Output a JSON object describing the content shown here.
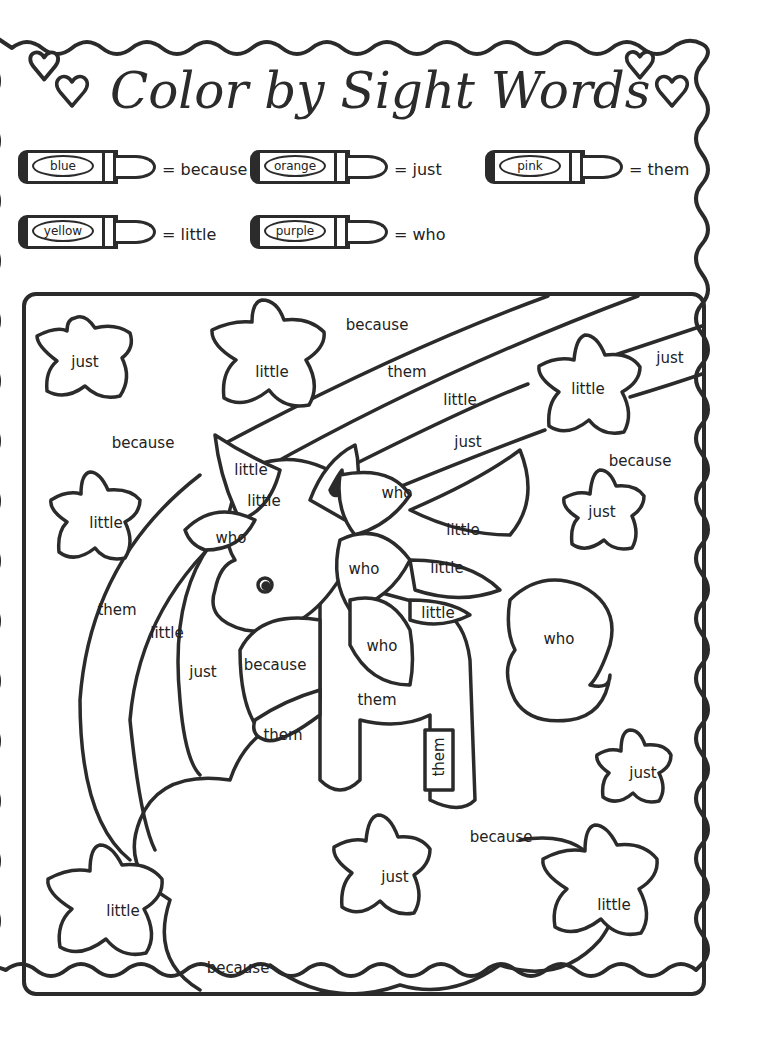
{
  "worksheet": {
    "title": "Color by Sight Words",
    "decorations": [
      "heart-icon",
      "heart-icon",
      "heart-icon",
      "heart-icon"
    ]
  },
  "key": [
    {
      "color": "blue",
      "hex": "#3b6fd8",
      "word": "= because"
    },
    {
      "color": "orange",
      "hex": "#f28c28",
      "word": "= just"
    },
    {
      "color": "pink",
      "hex": "#f48fb1",
      "word": "= them"
    },
    {
      "color": "yellow",
      "hex": "#f5d90a",
      "word": "= little"
    },
    {
      "color": "purple",
      "hex": "#8e44ad",
      "word": "= who"
    }
  ],
  "regions": [
    {
      "word": "just",
      "shape": "star",
      "x": 85,
      "y": 362
    },
    {
      "word": "little",
      "shape": "star",
      "x": 272,
      "y": 372
    },
    {
      "word": "because",
      "shape": "sky",
      "x": 377,
      "y": 325
    },
    {
      "word": "them",
      "shape": "rainbow",
      "x": 407,
      "y": 372
    },
    {
      "word": "little",
      "shape": "rainbow",
      "x": 460,
      "y": 400
    },
    {
      "word": "just",
      "shape": "rainbow",
      "x": 468,
      "y": 442
    },
    {
      "word": "little",
      "shape": "star",
      "x": 588,
      "y": 389
    },
    {
      "word": "just",
      "shape": "rainbow",
      "x": 670,
      "y": 358
    },
    {
      "word": "because",
      "shape": "sky",
      "x": 143,
      "y": 443
    },
    {
      "word": "because",
      "shape": "sky",
      "x": 640,
      "y": 461
    },
    {
      "word": "little",
      "shape": "horn",
      "x": 251,
      "y": 470
    },
    {
      "word": "little",
      "shape": "horn",
      "x": 264,
      "y": 501
    },
    {
      "word": "who",
      "shape": "mane",
      "x": 397,
      "y": 493
    },
    {
      "word": "little",
      "shape": "star",
      "x": 106,
      "y": 523
    },
    {
      "word": "just",
      "shape": "star",
      "x": 602,
      "y": 512
    },
    {
      "word": "who",
      "shape": "mane",
      "x": 231,
      "y": 538
    },
    {
      "word": "little",
      "shape": "mane",
      "x": 463,
      "y": 530
    },
    {
      "word": "who",
      "shape": "mane",
      "x": 364,
      "y": 569
    },
    {
      "word": "little",
      "shape": "mane",
      "x": 447,
      "y": 568
    },
    {
      "word": "little",
      "shape": "mane",
      "x": 438,
      "y": 613
    },
    {
      "word": "them",
      "shape": "rainbow",
      "x": 117,
      "y": 610
    },
    {
      "word": "little",
      "shape": "rainbow",
      "x": 167,
      "y": 633
    },
    {
      "word": "who",
      "shape": "mane",
      "x": 382,
      "y": 646
    },
    {
      "word": "who",
      "shape": "tail",
      "x": 559,
      "y": 639
    },
    {
      "word": "just",
      "shape": "rainbow",
      "x": 203,
      "y": 672
    },
    {
      "word": "because",
      "shape": "wing",
      "x": 275,
      "y": 665
    },
    {
      "word": "them",
      "shape": "body",
      "x": 377,
      "y": 700
    },
    {
      "word": "them",
      "shape": "wing",
      "x": 283,
      "y": 735
    },
    {
      "word": "them",
      "shape": "leg",
      "x": 439,
      "y": 757
    },
    {
      "word": "just",
      "shape": "star",
      "x": 643,
      "y": 773
    },
    {
      "word": "because",
      "shape": "sky",
      "x": 501,
      "y": 837
    },
    {
      "word": "just",
      "shape": "star",
      "x": 395,
      "y": 877
    },
    {
      "word": "little",
      "shape": "star",
      "x": 123,
      "y": 911
    },
    {
      "word": "little",
      "shape": "star",
      "x": 614,
      "y": 905
    },
    {
      "word": "because",
      "shape": "sky",
      "x": 238,
      "y": 968
    }
  ]
}
